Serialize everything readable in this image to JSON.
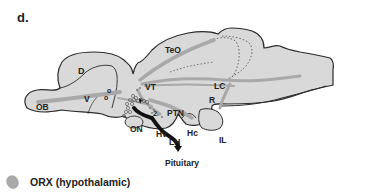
{
  "panel": {
    "label": "d."
  },
  "diagram": {
    "regions": {
      "OB": "OB",
      "D": "D",
      "V": "V",
      "TeO": "TeO",
      "VT": "VT",
      "LC": "LC",
      "R": "R",
      "PTN": "PTN",
      "ON": "ON",
      "Hv": "Hv",
      "Hc": "Hc",
      "LH": "LH",
      "IL": "IL",
      "num2": "2",
      "pituitary": "Pituitary",
      "o1": "o",
      "o2": "o"
    },
    "colors": {
      "tissue": "#d9d9d9",
      "outline": "#2a2a2a",
      "projection": "#a9a9a9",
      "pathway": "#111111"
    }
  },
  "legend": {
    "items": [
      {
        "label": "ORX (hypothalamic)",
        "color": "#a9a9a9"
      }
    ]
  }
}
